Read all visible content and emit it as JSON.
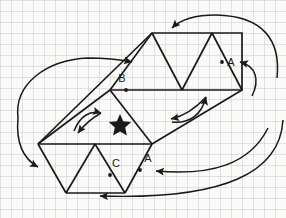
{
  "figure": {
    "background_color": "#fafaf8",
    "grid_color": "#cdcdd2",
    "stroke_color": "#1a1a1a",
    "labels": [
      {
        "name": "label-b",
        "text": "B",
        "x": 126,
        "y": 82,
        "dot_x": 126,
        "dot_y": 90
      },
      {
        "name": "label-a-right",
        "text": "A",
        "x": 231,
        "y": 64,
        "dot_x": 222,
        "dot_y": 62
      },
      {
        "name": "label-c",
        "text": "C",
        "x": 115,
        "y": 166,
        "dot_x": 110,
        "dot_y": 173
      },
      {
        "name": "label-a-bottom",
        "text": "A",
        "x": 146,
        "y": 161,
        "dot_x": 140,
        "dot_y": 168
      }
    ],
    "star": {
      "name": "star-marker",
      "x": 120,
      "y": 124,
      "size": 13
    },
    "net_vertices": {
      "top_left": [
        152,
        33
      ],
      "top_right": [
        242,
        33
      ],
      "mid_left": [
        110,
        90
      ],
      "mid_right": [
        242,
        90
      ],
      "low_left": [
        38,
        144
      ],
      "low_right": [
        152,
        144
      ],
      "bottom_left": [
        66,
        193
      ],
      "bottom_right": [
        125,
        193
      ]
    },
    "arrows": [
      {
        "name": "arrow-top-right-inward",
        "direction": "left",
        "description": "long curve from right edge into top face"
      },
      {
        "name": "arrow-left-long-in",
        "direction": "right",
        "description": "long curve from left sweeping right into upper-left edge"
      },
      {
        "name": "arrow-left-long-down",
        "direction": "down",
        "description": "long curve from left down into lower-left face"
      },
      {
        "name": "arrow-small-left-up",
        "direction": "up-right",
        "description": "short curve above left face"
      },
      {
        "name": "arrow-small-left-down",
        "direction": "down-left",
        "description": "short curve into left face"
      },
      {
        "name": "arrow-small-right-up",
        "direction": "up",
        "description": "short curve up to right lower edge"
      },
      {
        "name": "arrow-small-right-in",
        "direction": "left",
        "description": "short curve pointing left into middle face"
      },
      {
        "name": "arrow-right-to-a",
        "direction": "left",
        "description": "curve from right to label A"
      },
      {
        "name": "arrow-right-to-a-bottom",
        "direction": "left",
        "description": "curve from right to lower label A"
      },
      {
        "name": "arrow-bottom-long",
        "direction": "left",
        "description": "long curve from right into bottom edge"
      }
    ]
  }
}
